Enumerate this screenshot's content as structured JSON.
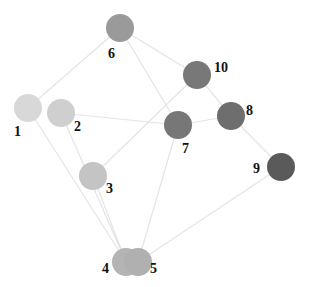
{
  "graph": {
    "type": "network",
    "edge_color": "#e4e4e4",
    "label_color": "#111111",
    "node_radius": 14,
    "nodes": [
      {
        "id": "1",
        "label": "1",
        "x": 28,
        "y": 108,
        "color": "#d8d8d8",
        "label_x": 14,
        "label_y": 136
      },
      {
        "id": "2",
        "label": "2",
        "x": 61,
        "y": 113,
        "color": "#cfcfcf",
        "label_x": 74,
        "label_y": 131
      },
      {
        "id": "3",
        "label": "3",
        "x": 93,
        "y": 176,
        "color": "#c4c4c4",
        "label_x": 106,
        "label_y": 193
      },
      {
        "id": "4",
        "label": "4",
        "x": 126,
        "y": 262,
        "color": "#b4b4b4",
        "label_x": 102,
        "label_y": 273
      },
      {
        "id": "5",
        "label": "5",
        "x": 138,
        "y": 262,
        "color": "#b0b0b0",
        "label_x": 150,
        "label_y": 273
      },
      {
        "id": "6",
        "label": "6",
        "x": 120,
        "y": 28,
        "color": "#9a9a9a",
        "label_x": 108,
        "label_y": 58
      },
      {
        "id": "7",
        "label": "7",
        "x": 178,
        "y": 125,
        "color": "#777777",
        "label_x": 182,
        "label_y": 153
      },
      {
        "id": "8",
        "label": "8",
        "x": 231,
        "y": 116,
        "color": "#6e6e6e",
        "label_x": 246,
        "label_y": 115
      },
      {
        "id": "9",
        "label": "9",
        "x": 281,
        "y": 167,
        "color": "#5a5a5a",
        "label_x": 253,
        "label_y": 173
      },
      {
        "id": "10",
        "label": "10",
        "x": 197,
        "y": 75,
        "color": "#787878",
        "label_x": 214,
        "label_y": 72
      }
    ],
    "edges": [
      [
        "1",
        "6"
      ],
      [
        "1",
        "4"
      ],
      [
        "2",
        "7"
      ],
      [
        "2",
        "4"
      ],
      [
        "3",
        "10"
      ],
      [
        "3",
        "4"
      ],
      [
        "6",
        "10"
      ],
      [
        "6",
        "7"
      ],
      [
        "7",
        "8"
      ],
      [
        "10",
        "8"
      ],
      [
        "8",
        "9"
      ],
      [
        "7",
        "5"
      ],
      [
        "9",
        "5"
      ]
    ]
  }
}
